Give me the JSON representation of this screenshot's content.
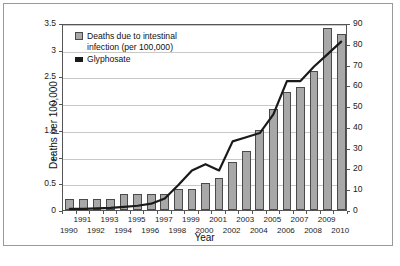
{
  "chart_data": {
    "type": "bar",
    "title": "",
    "xlabel": "Year",
    "ylabel": "Deaths per 100,000",
    "ylabel_right": "Glyphosate application (1000 tons)",
    "grid": true,
    "legend_position": "top-left",
    "categories": [
      "1990",
      "1991",
      "1992",
      "1993",
      "1994",
      "1995",
      "1996",
      "1997",
      "1998",
      "1999",
      "2000",
      "2001",
      "2002",
      "2003",
      "2004",
      "2005",
      "2006",
      "2007",
      "2008",
      "2009",
      "2010"
    ],
    "ylim": [
      0,
      3.5
    ],
    "ylim_right": [
      0,
      90
    ],
    "yticks": [
      "0",
      "0.5",
      "1",
      "1.5",
      "2",
      "2.5",
      "3",
      "3.5"
    ],
    "yticks_right": [
      "0",
      "10",
      "20",
      "30",
      "40",
      "50",
      "60",
      "70",
      "80",
      "90"
    ],
    "series": [
      {
        "name": "Deaths due to intestinal infection (per 100,000)",
        "type": "bar",
        "axis": "left",
        "color": "#a8a8a8",
        "values": [
          0.2,
          0.2,
          0.2,
          0.2,
          0.3,
          0.3,
          0.3,
          0.3,
          0.4,
          0.4,
          0.5,
          0.6,
          0.9,
          1.1,
          1.5,
          1.9,
          2.2,
          2.3,
          2.6,
          3.4,
          3.3
        ]
      },
      {
        "name": "Glyphosate",
        "type": "line",
        "axis": "right",
        "color": "#1a1a1a",
        "values": [
          1.5,
          1.5,
          1.7,
          2.0,
          2.5,
          3.0,
          4.0,
          6.5,
          13.0,
          20.0,
          23.0,
          20.0,
          34.0,
          36.0,
          38.0,
          47.0,
          63.0,
          63.0,
          70.0,
          76.0,
          82.0
        ]
      }
    ],
    "legend": [
      {
        "label": "Deaths due to intestinal\ninfection (per 100,000)",
        "swatch": "bar"
      },
      {
        "label": "Glyphosate",
        "swatch": "line"
      }
    ],
    "xtick_labels_row_top": [
      "1991",
      "1993",
      "1995",
      "1997",
      "1999",
      "2001",
      "2003",
      "2005",
      "2007",
      "2009"
    ],
    "xtick_labels_row_bottom": [
      "1990",
      "1992",
      "1994",
      "1996",
      "1998",
      "2000",
      "2002",
      "2004",
      "2006",
      "2008",
      "2010"
    ]
  },
  "watermark": ""
}
